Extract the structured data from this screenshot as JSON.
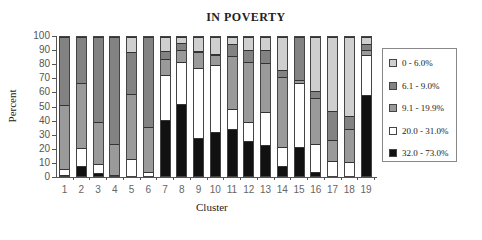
{
  "chart_data": {
    "type": "bar",
    "stacked": true,
    "title": "IN POVERTY",
    "xlabel": "Cluster",
    "ylabel": "Percent",
    "ylim": [
      0,
      100
    ],
    "yticks": [
      "0",
      "10",
      "20",
      "30",
      "40",
      "50",
      "60",
      "70",
      "80",
      "90",
      "100"
    ],
    "categories": [
      "1",
      "2",
      "3",
      "4",
      "5",
      "6",
      "7",
      "8",
      "9",
      "10",
      "11",
      "12",
      "13",
      "14",
      "15",
      "16",
      "17",
      "18",
      "19"
    ],
    "legend_position": "right",
    "grid": false,
    "series": [
      {
        "name": "32.0 - 73.0%",
        "color": "#111111",
        "values": [
          1,
          7,
          2,
          0,
          0,
          0,
          40,
          52,
          27,
          32,
          34,
          25,
          22,
          7,
          21,
          3,
          0,
          0,
          58
        ]
      },
      {
        "name": "20.0 - 31.0%",
        "color": "#ffffff",
        "values": [
          4,
          13,
          7,
          1,
          12,
          3,
          33,
          30,
          51,
          48,
          14,
          14,
          24,
          14,
          46,
          20,
          11,
          10,
          29
        ]
      },
      {
        "name": "9.1 - 19.9%",
        "color": "#a8a8a8",
        "values": [
          46,
          47,
          30,
          22,
          47,
          32,
          11,
          9,
          11,
          7,
          38,
          43,
          35,
          50,
          2,
          33,
          15,
          24,
          4
        ]
      },
      {
        "name": "6.1 - 9.0%",
        "color": "#6e6e6e",
        "values": [
          49,
          33,
          61,
          77,
          30,
          65,
          6,
          5,
          1,
          1,
          9,
          9,
          10,
          5,
          31,
          5,
          21,
          9,
          4
        ]
      },
      {
        "name": "0 - 6.0%",
        "color": "#dcdcdc",
        "values": [
          0,
          0,
          0,
          0,
          11,
          0,
          10,
          4,
          10,
          12,
          5,
          9,
          9,
          24,
          0,
          39,
          53,
          57,
          5
        ]
      }
    ],
    "legend_order": [
      "0 - 6.0%",
      "6.1 - 9.0%",
      "9.1 - 19.9%",
      "20.0 - 31.0%",
      "32.0 - 73.0%"
    ]
  }
}
